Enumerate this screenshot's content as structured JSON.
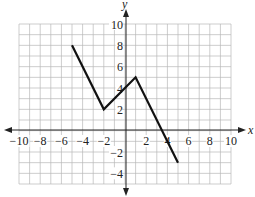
{
  "chart_data": {
    "type": "line",
    "title": "",
    "xlabel": "x",
    "ylabel": "y",
    "xlim": [
      -10,
      10
    ],
    "ylim": [
      -5,
      10
    ],
    "grid": true,
    "x_ticks": [
      -10,
      -8,
      -6,
      -4,
      -2,
      2,
      4,
      6,
      8,
      10
    ],
    "y_ticks": [
      10,
      8,
      6,
      4,
      2,
      -2,
      -4
    ],
    "x_tick_labels": [
      "−10",
      "−8",
      "−6",
      "−4",
      "−2",
      "2",
      "4",
      "6",
      "8",
      "10"
    ],
    "y_tick_labels": [
      "10",
      "8",
      "6",
      "4",
      "2",
      "−2",
      "−4"
    ],
    "series": [
      {
        "name": "piecewise linear",
        "x": [
          -5,
          -2,
          1,
          5
        ],
        "y": [
          8,
          2,
          5,
          -3
        ],
        "color": "#111111"
      }
    ]
  },
  "labels": {
    "x_axis": "x",
    "y_axis": "y"
  }
}
